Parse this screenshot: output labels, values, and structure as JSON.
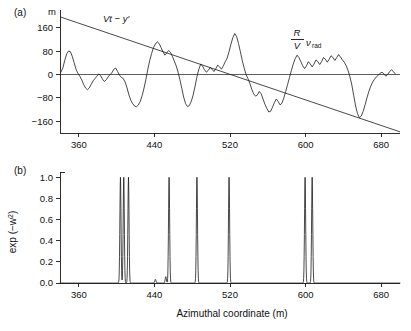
{
  "figure": {
    "panel_a_letter": "(a)",
    "panel_b_letter": "(b)",
    "xlabel": "Azimuthal coordinate (m)",
    "a_unit_label": "m",
    "a_annotation_left": "Vt − y′",
    "a_annotation_right_num": "R",
    "a_annotation_right_den": "V",
    "a_annotation_right_sym": "ν",
    "a_annotation_right_sub": "rad",
    "b_ylabel_main": "exp (−w",
    "b_ylabel_sup": "2",
    "b_ylabel_close": ")"
  },
  "chart_data": [
    {
      "type": "line",
      "panel": "(a)",
      "title": "",
      "xlabel": "",
      "ylabel": "m",
      "xlim": [
        340,
        700
      ],
      "ylim": [
        -200,
        200
      ],
      "xticks": [
        360,
        440,
        520,
        600,
        680
      ],
      "yticks": [
        160,
        80,
        0,
        -80,
        -160
      ],
      "grid": false,
      "legend": false,
      "annotations": [
        {
          "text": "Vt − y′",
          "x": 395,
          "y": 170
        },
        {
          "text": "R/V ν_rad",
          "x": 633,
          "y": 115
        }
      ],
      "series": [
        {
          "name": "R/V nu_rad",
          "comment": "irregular radial-velocity trace",
          "x": [
            341,
            343,
            345,
            347,
            349,
            351,
            353,
            355,
            357,
            359,
            361,
            363,
            365,
            367,
            369,
            371,
            373,
            375,
            377,
            379,
            381,
            383,
            385,
            387,
            389,
            391,
            393,
            395,
            397,
            399,
            401,
            403,
            405,
            407,
            409,
            411,
            413,
            415,
            417,
            419,
            421,
            423,
            425,
            427,
            429,
            431,
            433,
            435,
            437,
            439,
            441,
            443,
            445,
            447,
            449,
            451,
            453,
            455,
            457,
            459,
            461,
            463,
            465,
            467,
            469,
            471,
            473,
            475,
            477,
            479,
            481,
            483,
            485,
            487,
            489,
            491,
            493,
            495,
            497,
            499,
            501,
            503,
            505,
            507,
            509,
            511,
            513,
            515,
            517,
            519,
            521,
            523,
            525,
            527,
            529,
            531,
            533,
            535,
            537,
            539,
            541,
            543,
            545,
            547,
            549,
            551,
            553,
            555,
            557,
            559,
            561,
            563,
            565,
            567,
            569,
            571,
            573,
            575,
            577,
            579,
            581,
            583,
            585,
            587,
            589,
            591,
            593,
            595,
            597,
            599,
            601,
            603,
            605,
            607,
            609,
            611,
            613,
            615,
            617,
            619,
            621,
            623,
            625,
            627,
            629,
            631,
            633,
            635,
            637,
            639,
            641,
            643,
            645,
            647,
            649,
            651,
            653,
            655,
            657,
            659,
            661,
            663,
            665,
            667,
            669,
            671,
            673,
            675,
            677,
            679,
            681,
            683,
            685,
            687,
            689,
            691,
            693,
            695
          ],
          "y": [
            8,
            22,
            48,
            70,
            80,
            78,
            62,
            40,
            18,
            4,
            -6,
            -18,
            -34,
            -46,
            -52,
            -46,
            -34,
            -22,
            -14,
            -6,
            2,
            -4,
            -16,
            -24,
            -18,
            -8,
            0,
            6,
            18,
            22,
            10,
            -2,
            -10,
            -14,
            -26,
            -46,
            -70,
            -88,
            -100,
            -108,
            -110,
            -104,
            -92,
            -72,
            -46,
            -16,
            18,
            48,
            72,
            92,
            104,
            112,
            106,
            92,
            78,
            66,
            74,
            82,
            76,
            62,
            46,
            30,
            8,
            -18,
            -48,
            -78,
            -100,
            -110,
            -106,
            -92,
            -70,
            -40,
            -8,
            18,
            36,
            28,
            16,
            8,
            14,
            24,
            18,
            10,
            20,
            32,
            26,
            18,
            30,
            44,
            56,
            78,
            104,
            126,
            140,
            130,
            106,
            78,
            48,
            22,
            0,
            -14,
            -30,
            -50,
            -66,
            -74,
            -70,
            -58,
            -66,
            -84,
            -102,
            -116,
            -128,
            -126,
            -112,
            -96,
            -84,
            -92,
            -104,
            -98,
            -80,
            -58,
            -34,
            -10,
            14,
            36,
            54,
            66,
            58,
            44,
            30,
            20,
            30,
            44,
            36,
            26,
            36,
            50,
            44,
            34,
            44,
            58,
            52,
            42,
            52,
            64,
            58,
            48,
            58,
            68,
            60,
            50,
            42,
            30,
            14,
            -8,
            -36,
            -72,
            -108,
            -134,
            -148,
            -142,
            -126,
            -104,
            -80,
            -58,
            -40,
            -26,
            -16,
            -8,
            -2,
            4,
            8,
            2,
            -6,
            0,
            10,
            16,
            10,
            2,
            8,
            18,
            12,
            4,
            10,
            20,
            14,
            6,
            14,
            26,
            36,
            50,
            62,
            54,
            40,
            26,
            46,
            62,
            54,
            40,
            20,
            -10,
            -50,
            -90,
            -118,
            -132,
            -136
          ]
        },
        {
          "name": "Vt - y'",
          "comment": "straight descending line",
          "x": [
            341,
            700
          ],
          "y": [
            196,
            -196
          ]
        }
      ]
    },
    {
      "type": "line",
      "panel": "(b)",
      "title": "",
      "xlabel": "Azimuthal coordinate (m)",
      "ylabel": "exp (−w²)",
      "xlim": [
        340,
        700
      ],
      "ylim": [
        0.0,
        1.05
      ],
      "xticks": [
        360,
        440,
        520,
        600,
        680
      ],
      "yticks": [
        0.0,
        0.2,
        0.4,
        0.6,
        0.8,
        1.0
      ],
      "ytick_labels": [
        "0.0",
        "0.2",
        "0.4",
        "0.6",
        "0.8",
        "1.0"
      ],
      "grid": false,
      "legend": false,
      "comment": "narrow Gaussian spikes of unit peak height",
      "peaks": [
        {
          "center": 404.0,
          "height": 1.0,
          "width": 0.85
        },
        {
          "center": 407.5,
          "height": 1.0,
          "width": 0.85
        },
        {
          "center": 412.5,
          "height": 1.0,
          "width": 0.85
        },
        {
          "center": 441.0,
          "height": 0.035,
          "width": 0.9
        },
        {
          "center": 452.0,
          "height": 0.06,
          "width": 0.9
        },
        {
          "center": 455.5,
          "height": 1.0,
          "width": 0.85
        },
        {
          "center": 485.0,
          "height": 1.0,
          "width": 0.85
        },
        {
          "center": 519.0,
          "height": 1.0,
          "width": 0.85
        },
        {
          "center": 599.5,
          "height": 1.0,
          "width": 0.85
        },
        {
          "center": 607.0,
          "height": 1.0,
          "width": 0.85
        }
      ]
    }
  ]
}
